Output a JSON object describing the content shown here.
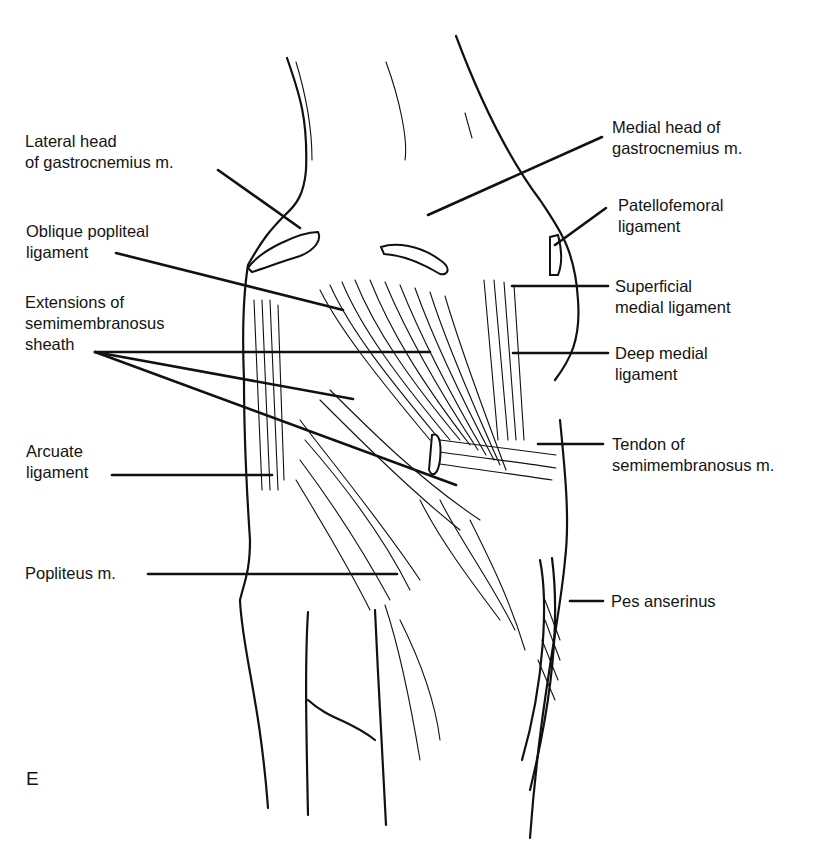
{
  "figure": {
    "panel_letter": "E",
    "view": "Posterior view of the knee (posteromedial structures)",
    "labels_left": [
      {
        "id": "lateral-head-gastrocnemius",
        "lines": [
          "Lateral head",
          "of gastrocnemius m."
        ]
      },
      {
        "id": "oblique-popliteal-ligament",
        "lines": [
          "Oblique popliteal",
          "ligament"
        ]
      },
      {
        "id": "extensions-semimembranosus-sheath",
        "lines": [
          "Extensions of",
          "semimembranosus",
          "sheath"
        ]
      },
      {
        "id": "arcuate-ligament",
        "lines": [
          "Arcuate",
          "ligament"
        ]
      },
      {
        "id": "popliteus-muscle",
        "lines": [
          "Popliteus m."
        ]
      }
    ],
    "labels_right": [
      {
        "id": "medial-head-gastrocnemius",
        "lines": [
          "Medial head of",
          "gastrocnemius m."
        ]
      },
      {
        "id": "patellofemoral-ligament",
        "lines": [
          "Patellofemoral",
          "ligament"
        ]
      },
      {
        "id": "superficial-medial-ligament",
        "lines": [
          "Superficial",
          "medial ligament"
        ]
      },
      {
        "id": "deep-medial-ligament",
        "lines": [
          "Deep medial",
          "ligament"
        ]
      },
      {
        "id": "tendon-semimembranosus",
        "lines": [
          "Tendon of",
          "semimembranosus m."
        ]
      },
      {
        "id": "pes-anserinus",
        "lines": [
          "Pes anserinus"
        ]
      }
    ],
    "colors": {
      "ink": "#111111",
      "background": "#ffffff"
    }
  }
}
